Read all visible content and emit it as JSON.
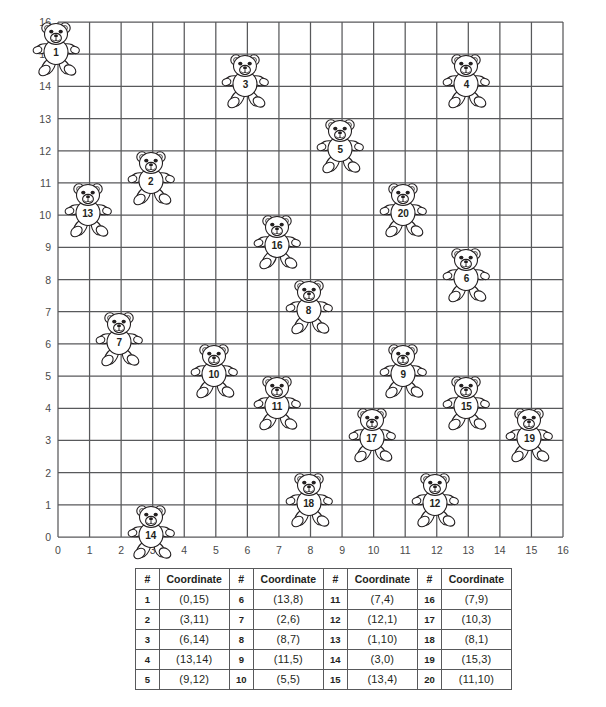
{
  "chart_data": {
    "type": "scatter",
    "title": "",
    "xlabel": "",
    "ylabel": "",
    "xlim": [
      0,
      16
    ],
    "ylim": [
      0,
      16
    ],
    "grid": true,
    "legend": "none",
    "marker": "teddy-bear",
    "x_ticks": [
      0,
      1,
      2,
      3,
      4,
      5,
      6,
      7,
      8,
      9,
      10,
      11,
      12,
      13,
      14,
      15,
      16
    ],
    "y_ticks": [
      0,
      1,
      2,
      3,
      4,
      5,
      6,
      7,
      8,
      9,
      10,
      11,
      12,
      13,
      14,
      15,
      16
    ],
    "points": [
      {
        "label": "1",
        "x": 0,
        "y": 15
      },
      {
        "label": "2",
        "x": 3,
        "y": 11
      },
      {
        "label": "3",
        "x": 6,
        "y": 14
      },
      {
        "label": "4",
        "x": 13,
        "y": 14
      },
      {
        "label": "5",
        "x": 9,
        "y": 12
      },
      {
        "label": "6",
        "x": 13,
        "y": 8
      },
      {
        "label": "7",
        "x": 2,
        "y": 6
      },
      {
        "label": "8",
        "x": 8,
        "y": 7
      },
      {
        "label": "9",
        "x": 11,
        "y": 5
      },
      {
        "label": "10",
        "x": 5,
        "y": 5
      },
      {
        "label": "11",
        "x": 7,
        "y": 4
      },
      {
        "label": "12",
        "x": 12,
        "y": 1
      },
      {
        "label": "13",
        "x": 1,
        "y": 10
      },
      {
        "label": "14",
        "x": 3,
        "y": 0
      },
      {
        "label": "15",
        "x": 13,
        "y": 4
      },
      {
        "label": "16",
        "x": 7,
        "y": 9
      },
      {
        "label": "17",
        "x": 10,
        "y": 3
      },
      {
        "label": "18",
        "x": 8,
        "y": 1
      },
      {
        "label": "19",
        "x": 15,
        "y": 3
      },
      {
        "label": "20",
        "x": 11,
        "y": 10
      }
    ]
  },
  "table": {
    "headers": [
      "#",
      "Coordinate",
      "#",
      "Coordinate",
      "#",
      "Coordinate",
      "#",
      "Coordinate"
    ],
    "rows": [
      [
        "1",
        "(0,15)",
        "6",
        "(13,8)",
        "11",
        "(7,4)",
        "16",
        "(7,9)"
      ],
      [
        "2",
        "(3,11)",
        "7",
        "(2,6)",
        "12",
        "(12,1)",
        "17",
        "(10,3)"
      ],
      [
        "3",
        "(6,14)",
        "8",
        "(8,7)",
        "13",
        "(1,10)",
        "18",
        "(8,1)"
      ],
      [
        "4",
        "(13,14)",
        "9",
        "(11,5)",
        "14",
        "(3,0)",
        "19",
        "(15,3)"
      ],
      [
        "5",
        "(9,12)",
        "10",
        "(5,5)",
        "15",
        "(13,4)",
        "20",
        "(11,10)"
      ]
    ]
  },
  "colors": {
    "grid_line": "#58595b",
    "axis_text": "#4a4a4a",
    "bear_outline": "#231f20",
    "background": "#ffffff",
    "table_border": "#58595b"
  }
}
